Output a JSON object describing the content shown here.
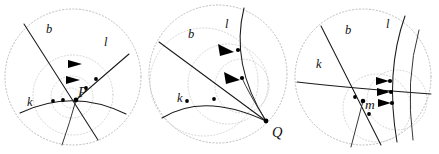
{
  "figure": {
    "background_color": "#ffffff",
    "stroke_color": "#1a1a1a",
    "dashed_circle_color": "#bdbdbd",
    "guide_circle_color": "#cfcfcf",
    "width": 439,
    "height": 154,
    "panel_count": 3
  },
  "panels": [
    {
      "id": "panel-1",
      "name": "panel-left",
      "index": 1,
      "origin_x": 0,
      "boundary": {
        "cx": 73,
        "cy": 77,
        "r": 68
      },
      "guide_circles": [
        {
          "cx": 73,
          "cy": 95,
          "r": 38
        },
        {
          "cx": 70,
          "cy": 97,
          "r": 20
        },
        {
          "cx": 71,
          "cy": 98,
          "r": 10
        }
      ],
      "curve_labels": [
        {
          "id": "label-b",
          "text": "b",
          "x": 46,
          "y": 33
        },
        {
          "id": "label-l",
          "text": "l",
          "x": 104,
          "y": 46
        },
        {
          "id": "label-k",
          "text": "k",
          "x": 29,
          "y": 104
        }
      ],
      "point_labels": [
        {
          "id": "label-P",
          "text": "P",
          "x": 77,
          "y": 96
        }
      ],
      "dots": [
        {
          "id": "dot-k-1",
          "x": 53,
          "y": 101
        },
        {
          "id": "dot-k-2",
          "x": 63,
          "y": 100
        },
        {
          "id": "dot-P",
          "x": 76,
          "y": 100
        },
        {
          "id": "dot-l-1",
          "x": 86,
          "y": 87
        },
        {
          "id": "dot-l-2",
          "x": 96,
          "y": 79
        }
      ],
      "arrows": [
        {
          "id": "arrow-upper",
          "x": 76,
          "y": 64,
          "angle": 0
        },
        {
          "id": "arrow-lower",
          "x": 74,
          "y": 80,
          "angle": 0
        }
      ]
    },
    {
      "id": "panel-2",
      "name": "panel-middle",
      "index": 2,
      "origin_x": 146,
      "boundary": {
        "cx": 72,
        "cy": 74,
        "r": 69
      },
      "guide_circles": [
        {
          "cx": 60,
          "cy": 82,
          "r": 52
        },
        {
          "cx": 84,
          "cy": 82,
          "r": 40
        },
        {
          "cx": 96,
          "cy": 84,
          "r": 28
        }
      ],
      "curve_labels": [
        {
          "id": "label-b",
          "text": "b",
          "x": 42,
          "y": 38
        },
        {
          "id": "label-l",
          "text": "l",
          "x": 79,
          "y": 28
        },
        {
          "id": "label-k",
          "text": "k",
          "x": 33,
          "y": 100
        }
      ],
      "point_labels": [
        {
          "id": "label-Q",
          "text": "Q",
          "x": 131,
          "y": 135
        }
      ],
      "dots": [
        {
          "id": "dot-k-1",
          "x": 41,
          "y": 101
        },
        {
          "id": "dot-k-2",
          "x": 68,
          "y": 99
        },
        {
          "id": "dot-l-1",
          "x": 92,
          "y": 50
        },
        {
          "id": "dot-l-2",
          "x": 96,
          "y": 78
        },
        {
          "id": "dot-Q",
          "x": 120,
          "y": 121
        }
      ],
      "arrows": [
        {
          "id": "arrow-upper",
          "x": 82,
          "y": 52,
          "angle": 35
        },
        {
          "id": "arrow-lower",
          "x": 88,
          "y": 80,
          "angle": 40
        }
      ]
    },
    {
      "id": "panel-3",
      "name": "panel-right",
      "index": 3,
      "origin_x": 293,
      "boundary": {
        "cx": 70,
        "cy": 77,
        "r": 68
      },
      "guide_circles": [
        {
          "cx": 82,
          "cy": 106,
          "r": 34
        },
        {
          "cx": 102,
          "cy": 99,
          "r": 30
        }
      ],
      "curve_labels": [
        {
          "id": "label-b",
          "text": "b",
          "x": 52,
          "y": 33
        },
        {
          "id": "label-l",
          "text": "l",
          "x": 93,
          "y": 27
        },
        {
          "id": "label-k",
          "text": "k",
          "x": 25,
          "y": 66
        }
      ],
      "point_labels": [
        {
          "id": "label-m",
          "text": "m",
          "x": 73,
          "y": 106
        }
      ],
      "dots": [
        {
          "id": "dot-k-1",
          "x": 62,
          "y": 97
        },
        {
          "id": "dot-m",
          "x": 70,
          "y": 101
        },
        {
          "id": "dot-r-1",
          "x": 97,
          "y": 81
        },
        {
          "id": "dot-r-2",
          "x": 98,
          "y": 92
        },
        {
          "id": "dot-r-3",
          "x": 99,
          "y": 102
        },
        {
          "id": "dot-b-low",
          "x": 75,
          "y": 113
        }
      ],
      "arrows": [
        {
          "id": "arrow-top",
          "x": 90,
          "y": 81,
          "angle": 0
        },
        {
          "id": "arrow-mid",
          "x": 90,
          "y": 92,
          "angle": 0
        },
        {
          "id": "arrow-bottom",
          "x": 91,
          "y": 103,
          "angle": 0
        }
      ]
    }
  ]
}
